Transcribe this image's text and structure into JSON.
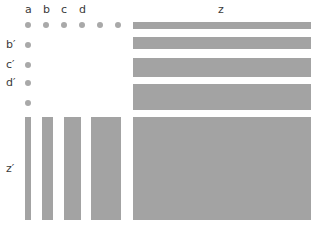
{
  "labels": {
    "top": [
      "a",
      "b",
      "c",
      "d"
    ],
    "right_title": "z",
    "left": [
      "b′",
      "c′",
      "d′"
    ],
    "bottom_left": "z′"
  },
  "colors": {
    "dot": "#a9a9a9",
    "bar": "#a3a3a3",
    "text": "#3a3a3a",
    "background": "#ffffff"
  },
  "dots": {
    "row_count": 6,
    "column_count": 4
  },
  "horizontal_bars": {
    "count": 4,
    "relative_heights": [
      7,
      12,
      19,
      26
    ]
  },
  "vertical_bars": {
    "count": 4,
    "relative_widths": [
      6,
      11,
      17,
      30
    ]
  }
}
